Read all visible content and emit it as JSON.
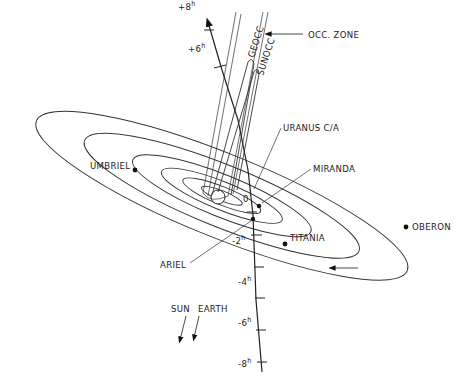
{
  "diagram": {
    "title": "",
    "occ_zone_label": "OCC. ZONE",
    "geocc_label": "GEOCC",
    "sunocc_label": "SUNOCC",
    "closest_approach_label": "URANUS C/A",
    "moons": [
      {
        "name": "UMBRIEL"
      },
      {
        "name": "MIRANDA"
      },
      {
        "name": "OBERON"
      },
      {
        "name": "TITANIA"
      },
      {
        "name": "ARIEL"
      }
    ],
    "time_ticks": [
      {
        "label": "+8",
        "unit": "h"
      },
      {
        "label": "+6",
        "unit": "h"
      },
      {
        "label": "0",
        "unit": ""
      },
      {
        "label": "-2",
        "unit": "h"
      },
      {
        "label": "-4",
        "unit": "h"
      },
      {
        "label": "-6",
        "unit": "h"
      },
      {
        "label": "-8",
        "unit": "h"
      }
    ],
    "direction_labels": {
      "sun": "SUN",
      "earth": "EARTH"
    }
  }
}
